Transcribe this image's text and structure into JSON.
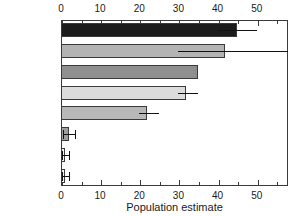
{
  "chart_data": {
    "type": "bar",
    "orientation": "horizontal",
    "title": "",
    "xlabel": "Population estimate",
    "ylabel": "",
    "categories": [
      "UKRAINE",
      "ROMANIA",
      "HUNGARY",
      "SLOVAKIA",
      "BULGARIA",
      "MOLDOVA",
      "GREECE",
      "CROATIA"
    ],
    "values": [
      45,
      42,
      35,
      32,
      22,
      2,
      1,
      1
    ],
    "errors_low": [
      40,
      30,
      null,
      30,
      20,
      0.5,
      0.3,
      0.3
    ],
    "errors_high": [
      50,
      58,
      null,
      35,
      25,
      3.5,
      2.0,
      2.0
    ],
    "bar_colors": [
      "#1c1c1c",
      "#b3b3b3",
      "#8f8f8f",
      "#dcdcdc",
      "#b8b8b8",
      "#9e9e9e",
      "#f2f2f2",
      "#f2f2f2"
    ],
    "bar_edge_color": "#3a3a3a",
    "error_color": "#111111",
    "xlim": [
      0,
      58
    ],
    "ylim": [
      0,
      8
    ],
    "grid": false,
    "legend": null,
    "xticks": [
      0,
      10,
      20,
      30,
      40,
      50
    ],
    "xtick_labels": [
      "0",
      "10",
      "20",
      "30",
      "40",
      "50"
    ],
    "xminor_step": 5,
    "axis_top": true,
    "axis_bottom": true,
    "frame": true
  }
}
